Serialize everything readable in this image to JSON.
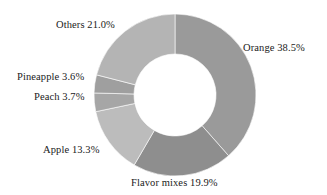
{
  "background_color": "#ffffff",
  "text_color": "#1a1a1a",
  "geometry": {
    "center_x": 175,
    "center_y": 95,
    "outer_radius": 81,
    "inner_radius": 41,
    "start_angle_deg": 0
  },
  "chart_data": {
    "type": "pie",
    "variant": "donut",
    "title": "",
    "subtitle": "",
    "xlabel": "",
    "ylabel": "",
    "legend_position": "none",
    "grid": false,
    "labels_placement": "outside",
    "value_unit": "%",
    "total": 100.0,
    "categories": [
      "Orange",
      "Flavor mixes",
      "Apple",
      "Peach",
      "Pineapple",
      "Others"
    ],
    "values": [
      38.5,
      19.9,
      13.3,
      3.7,
      3.6,
      21.0
    ],
    "slices": [
      {
        "name": "Orange",
        "value": 38.5,
        "label": "Orange 38.5%",
        "color": "#9a9a9a"
      },
      {
        "name": "Flavor mixes",
        "value": 19.9,
        "label": "Flavor mixes 19.9%",
        "color": "#8e8e8e"
      },
      {
        "name": "Apple",
        "value": 13.3,
        "label": "Apple 13.3%",
        "color": "#bcbcbc"
      },
      {
        "name": "Peach",
        "value": 3.7,
        "label": "Peach 3.7%",
        "color": "#a6a6a6"
      },
      {
        "name": "Pineapple",
        "value": 3.6,
        "label": "Pineapple 3.6%",
        "color": "#9f9f9f"
      },
      {
        "name": "Others",
        "value": 21.0,
        "label": "Others 21.0%",
        "color": "#b4b4b4"
      }
    ]
  },
  "labels": {
    "orange": "Orange 38.5%",
    "flavor_mixes": "Flavor mixes 19.9%",
    "apple": "Apple 13.3%",
    "peach": "Peach 3.7%",
    "pineapple": "Pineapple 3.6%",
    "others": "Others 21.0%"
  }
}
